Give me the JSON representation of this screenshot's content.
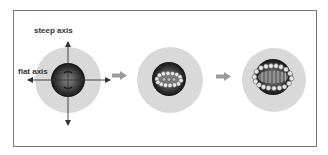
{
  "figure": {
    "labels": {
      "steep_axis": "steep axis",
      "flat_axis": "flat axis"
    },
    "panels": [
      {
        "id": "panel-1",
        "description": "sphere with crossed steep/flat axes"
      },
      {
        "id": "panel-2",
        "description": "sphere with small ring of circles"
      },
      {
        "id": "panel-3",
        "description": "sphere with enlarged elliptical ring of circles"
      }
    ],
    "colors": {
      "frame": "#7a7a7a",
      "halo": "#d9d9d9",
      "sphere_dark": "#1e1e1e",
      "sphere_light": "#8a8a8a",
      "arrow": "#9a9a9a",
      "axis": "#333333"
    }
  }
}
